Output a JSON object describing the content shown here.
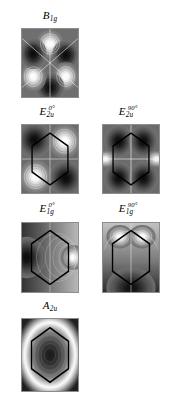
{
  "figure": {
    "kind": "multi-panel-contour-density-figure",
    "background_color": "#ffffff",
    "colormap": "grayscale",
    "panel_border_color": "#8d8d8d",
    "overlay_color": "#000000",
    "axis_cross_color": "#e8e8e8",
    "columns": 2,
    "rows": 4
  },
  "panels": [
    {
      "id": "b1g",
      "label_base": "B",
      "label_sub": "1g",
      "label_sup": "",
      "row": 1,
      "column": 1,
      "has_hexagon": false,
      "has_axis_cross": true,
      "pattern": "six-lobe-alternating",
      "lobes": [
        {
          "angle_deg": 90,
          "sign": "positive",
          "shade": "white"
        },
        {
          "angle_deg": 150,
          "sign": "negative",
          "shade": "dark"
        },
        {
          "angle_deg": 210,
          "sign": "positive",
          "shade": "white"
        },
        {
          "angle_deg": 270,
          "sign": "negative",
          "shade": "dark"
        },
        {
          "angle_deg": 330,
          "sign": "positive",
          "shade": "white"
        },
        {
          "angle_deg": 30,
          "sign": "negative",
          "shade": "dark"
        }
      ]
    },
    {
      "id": "e2u_0",
      "label_base": "E",
      "label_sub": "2u",
      "label_sup": "0°",
      "row": 2,
      "column": 1,
      "has_hexagon": true,
      "has_axis_cross": true,
      "pattern": "four-lobe-diagonal",
      "lobes": [
        {
          "angle_deg": 45,
          "sign": "positive",
          "shade": "white"
        },
        {
          "angle_deg": 135,
          "sign": "negative",
          "shade": "dark"
        },
        {
          "angle_deg": 225,
          "sign": "positive",
          "shade": "white"
        },
        {
          "angle_deg": 315,
          "sign": "negative",
          "shade": "dark"
        }
      ]
    },
    {
      "id": "e2u_90",
      "label_base": "E",
      "label_sub": "2u",
      "label_sup": "90°",
      "row": 2,
      "column": 2,
      "has_hexagon": true,
      "has_axis_cross": true,
      "pattern": "horizontal-bright-pair-dark-quadrants",
      "lobes": [
        {
          "angle_deg": 180,
          "sign": "positive",
          "shade": "white"
        },
        {
          "angle_deg": 0,
          "sign": "positive",
          "shade": "white"
        },
        {
          "angle_deg": 120,
          "sign": "negative",
          "shade": "dark"
        },
        {
          "angle_deg": 60,
          "sign": "negative",
          "shade": "dark"
        },
        {
          "angle_deg": 240,
          "sign": "negative",
          "shade": "dark"
        },
        {
          "angle_deg": 300,
          "sign": "negative",
          "shade": "dark"
        }
      ]
    },
    {
      "id": "e1g_0",
      "label_base": "E",
      "label_sub": "1g",
      "label_sup": "0°",
      "row": 3,
      "column": 1,
      "has_hexagon": true,
      "has_axis_cross": true,
      "pattern": "dipole-horizontal",
      "lobes": [
        {
          "angle_deg": 0,
          "sign": "positive",
          "shade": "white"
        },
        {
          "angle_deg": 180,
          "sign": "negative",
          "shade": "dark"
        }
      ]
    },
    {
      "id": "e1g_90",
      "label_base": "E",
      "label_sub": "1g",
      "label_sup": "90°",
      "row": 3,
      "column": 2,
      "has_hexagon": true,
      "has_axis_cross": true,
      "pattern": "dipole-vertical-split-top-bright",
      "lobes": [
        {
          "angle_deg": 105,
          "sign": "positive",
          "shade": "white"
        },
        {
          "angle_deg": 75,
          "sign": "positive",
          "shade": "white"
        },
        {
          "angle_deg": 270,
          "sign": "negative",
          "shade": "dark"
        }
      ]
    },
    {
      "id": "a2u",
      "label_base": "A",
      "label_sub": "2u",
      "label_sup": "",
      "row": 4,
      "column": 1,
      "has_hexagon": true,
      "has_axis_cross": false,
      "pattern": "concentric-rings-dark-center",
      "lobes": [
        {
          "angle_deg": 0,
          "sign": "negative",
          "shade": "dark-center"
        },
        {
          "angle_deg": 0,
          "sign": "positive",
          "shade": "bright-ring"
        }
      ]
    }
  ]
}
